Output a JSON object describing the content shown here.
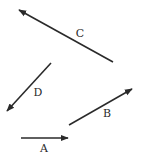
{
  "diagram": {
    "ink_color": "#2a2a2a",
    "background": "#ffffff",
    "vectors": [
      {
        "id": "A",
        "label": "A",
        "tail": [
          21,
          138
        ],
        "head": [
          68,
          138
        ],
        "label_pos": [
          44,
          148
        ]
      },
      {
        "id": "B",
        "label": "B",
        "tail": [
          69,
          125
        ],
        "head": [
          132,
          89
        ],
        "label_pos": [
          107,
          113
        ]
      },
      {
        "id": "C",
        "label": "C",
        "tail": [
          113,
          62
        ],
        "head": [
          19,
          10
        ],
        "label_pos": [
          80,
          33
        ]
      },
      {
        "id": "D",
        "label": "D",
        "tail": [
          51,
          63
        ],
        "head": [
          7,
          111
        ],
        "label_pos": [
          38,
          92
        ]
      }
    ]
  }
}
